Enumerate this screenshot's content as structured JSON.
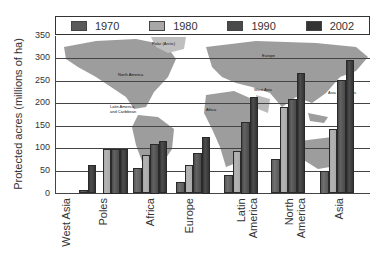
{
  "chart_data": {
    "type": "bar",
    "title": "",
    "xlabel": "",
    "ylabel": "Protected acres (millions of ha)",
    "ylim": [
      0,
      350
    ],
    "yticks": [
      0,
      50,
      100,
      150,
      200,
      250,
      300,
      350
    ],
    "grid": true,
    "legend_position": "top",
    "categories": [
      "West Asia",
      "Poles",
      "Africa",
      "Europe",
      "Latin America",
      "North America",
      "Asia"
    ],
    "series": [
      {
        "name": "1970",
        "color": "#5a5a5a",
        "values": [
          0,
          0,
          57,
          26,
          42,
          77,
          50
        ]
      },
      {
        "name": "1980",
        "color": "#a8a8a8",
        "values": [
          0,
          100,
          86,
          64,
          94,
          193,
          144
        ]
      },
      {
        "name": "1990",
        "color": "#4a4a4a",
        "values": [
          7,
          100,
          110,
          91,
          160,
          209,
          252
        ]
      },
      {
        "name": "2002",
        "color": "#333333",
        "values": [
          63,
          100,
          117,
          125,
          215,
          268,
          296
        ]
      }
    ],
    "background_map_labels": [
      "Polar (Arctic)",
      "Europe",
      "North America",
      "Latin America and Caribbean",
      "Africa",
      "West Asia",
      "Asia and Pacific"
    ]
  },
  "legend": [
    {
      "label": "1970",
      "color": "#5a5a5a"
    },
    {
      "label": "1980",
      "color": "#a8a8a8"
    },
    {
      "label": "1990",
      "color": "#4a4a4a"
    },
    {
      "label": "2002",
      "color": "#333333"
    }
  ],
  "axis": {
    "ylabel": "Protected acres (millions of ha)",
    "yticks": [
      "350",
      "300",
      "250",
      "200",
      "150",
      "100",
      "50",
      "0"
    ]
  },
  "xlabels": [
    "West Asia",
    "Poles",
    "Africa",
    "Europe",
    "Latin\nAmerica",
    "North\nAmerica",
    "Asia"
  ],
  "map_labels": {
    "polar": "Polar (Arctic)",
    "europe": "Europe",
    "north_america": "North America",
    "latin_america": "Latin America\nand Caribbean",
    "africa": "Africa",
    "west_asia": "West Asia",
    "asia_pacific": "Asia and Pacific"
  }
}
